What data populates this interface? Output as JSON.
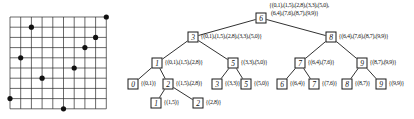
{
  "colors": {
    "background": "#ffffff",
    "grid_line": "#2a2a2a",
    "edge_line": "#1a1a1a",
    "point_fill": "#111111",
    "text": "#111111"
  },
  "grid": {
    "v_lines": 10,
    "h_lines": 10,
    "points": [
      [
        0,
        1
      ],
      [
        1,
        5
      ],
      [
        2,
        8
      ],
      [
        3,
        3
      ],
      [
        5,
        0
      ],
      [
        6,
        4
      ],
      [
        7,
        6
      ],
      [
        8,
        7
      ],
      [
        9,
        9
      ]
    ]
  },
  "tree": {
    "nodes": [
      {
        "id": "r6",
        "value": "6",
        "x": 261,
        "y": 18,
        "labels": [
          "{(0,1),(1,5),(2,8),(3,3),(5,0),",
          "(6,4),(7,6),(8,7),(9,9)}"
        ],
        "label_x": 269,
        "label_y": 2
      },
      {
        "id": "n3",
        "value": "3",
        "x": 193,
        "y": 37,
        "labels": [
          "{(0,1),(1,5),(2,8),(3,3),(5,0)}"
        ]
      },
      {
        "id": "n8",
        "value": "8",
        "x": 331,
        "y": 37,
        "labels": [
          "{(6,4),(7,6),(8,7),(9,9)}"
        ]
      },
      {
        "id": "n1",
        "value": "1",
        "x": 157,
        "y": 63,
        "labels": [
          "{(0,1),(1,5),(2,8)}"
        ]
      },
      {
        "id": "n5a",
        "value": "5",
        "x": 233,
        "y": 63,
        "labels": [
          "{(3,3),(5,0)}"
        ]
      },
      {
        "id": "n7",
        "value": "7",
        "x": 300,
        "y": 63,
        "labels": [
          "{(6,4),(7,6)}"
        ]
      },
      {
        "id": "n9a",
        "value": "9",
        "x": 362,
        "y": 63,
        "labels": [
          "{(8,7),(9,9)}"
        ]
      },
      {
        "id": "l0",
        "value": "0",
        "x": 133,
        "y": 84,
        "labels": [
          "{(0,1)}"
        ]
      },
      {
        "id": "n2",
        "value": "2",
        "x": 168,
        "y": 84,
        "labels": [
          "{(1,5),(2,8)}"
        ]
      },
      {
        "id": "l3",
        "value": "3",
        "x": 217,
        "y": 84,
        "labels": [
          "{(3,3)}"
        ]
      },
      {
        "id": "l5",
        "value": "5",
        "x": 246,
        "y": 84,
        "labels": [
          "{(5,0)}"
        ]
      },
      {
        "id": "l6",
        "value": "6",
        "x": 282,
        "y": 84,
        "labels": [
          "{(6,4)}"
        ]
      },
      {
        "id": "l7",
        "value": "7",
        "x": 314,
        "y": 84,
        "labels": [
          "{(7,6)}"
        ]
      },
      {
        "id": "l8",
        "value": "8",
        "x": 347,
        "y": 84,
        "labels": [
          "{(8,7)}"
        ]
      },
      {
        "id": "l9",
        "value": "9",
        "x": 381,
        "y": 84,
        "labels": [
          "{(9,9)}"
        ]
      },
      {
        "id": "m1",
        "value": "1",
        "x": 156,
        "y": 103,
        "labels": [
          "{(1,5)}"
        ]
      },
      {
        "id": "m2",
        "value": "2",
        "x": 198,
        "y": 103,
        "labels": [
          "{(2,8)}"
        ]
      }
    ],
    "edges": [
      [
        "r6",
        "n3"
      ],
      [
        "r6",
        "n8"
      ],
      [
        "n3",
        "n1"
      ],
      [
        "n3",
        "n5a"
      ],
      [
        "n8",
        "n7"
      ],
      [
        "n8",
        "n9a"
      ],
      [
        "n1",
        "l0"
      ],
      [
        "n1",
        "n2"
      ],
      [
        "n5a",
        "l3"
      ],
      [
        "n5a",
        "l5"
      ],
      [
        "n7",
        "l6"
      ],
      [
        "n7",
        "l7"
      ],
      [
        "n9a",
        "l8"
      ],
      [
        "n9a",
        "l9"
      ],
      [
        "n2",
        "m1"
      ],
      [
        "n2",
        "m2"
      ]
    ]
  }
}
